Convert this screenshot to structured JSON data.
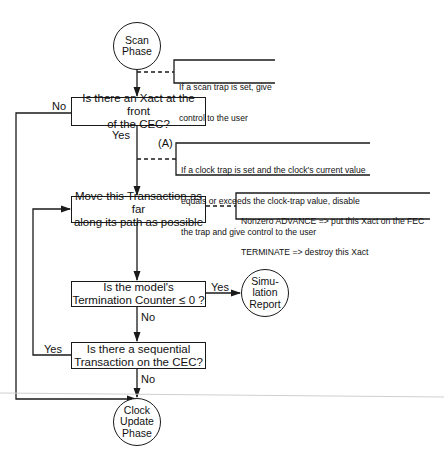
{
  "diagram": {
    "type": "flowchart",
    "nodes": {
      "scan_phase": {
        "line1": "Scan",
        "line2": "Phase"
      },
      "xact_front": {
        "line1": "Is there an Xact at the front",
        "line2": "of the CEC?"
      },
      "move_xact": {
        "line1": "Move this Transaction as far",
        "line2": "along its path as possible"
      },
      "termination": {
        "line1": "Is the model's",
        "line2": "Termination Counter ≤ 0 ?"
      },
      "sim_report": {
        "line1": "Simu-",
        "line2": "lation",
        "line3": "Report"
      },
      "sequential": {
        "line1": "Is there a sequential",
        "line2": "Transaction on the CEC?"
      },
      "clock_update": {
        "line1": "Clock",
        "line2": "Update",
        "line3": "Phase"
      }
    },
    "edge_labels": {
      "xact_front_no": "No",
      "xact_front_yes": "Yes",
      "marker_a": "(A)",
      "termination_yes": "Yes",
      "termination_no": "No",
      "sequential_yes": "Yes",
      "sequential_no": "No"
    },
    "annotations": {
      "scan_trap": {
        "line1": "If a scan trap is set, give",
        "line2": "control to the  user"
      },
      "clock_trap": {
        "line1": "If a  clock trap is set and the clock's current value",
        "line2": "equals or exceeds the clock-trap value, disable",
        "line3": "the trap and give control to the user"
      },
      "advance_terminate": {
        "line1": "Nonzero ADVANCE => put this Xact on the FEC",
        "line2": "TERMINATE => destroy this Xact"
      }
    },
    "colors": {
      "stroke": "#1a1a1a",
      "background": "#ffffff",
      "rule": "#c8c8c8"
    }
  }
}
